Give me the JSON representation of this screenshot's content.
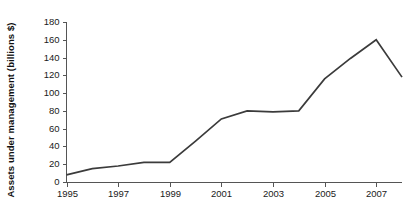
{
  "chart_data": {
    "type": "line",
    "title": "",
    "subtitle": "",
    "xlabel": "",
    "ylabel": "Assets under management (billions $)",
    "x": [
      1995,
      1996,
      1997,
      1998,
      1999,
      2000,
      2001,
      2002,
      2003,
      2004,
      2005,
      2006,
      2007,
      2008
    ],
    "series": [
      {
        "name": "Assets under management",
        "values": [
          8,
          15,
          18,
          22,
          22,
          46,
          71,
          80,
          79,
          80,
          116,
          139,
          160,
          118
        ]
      }
    ],
    "xlim": [
      1995,
      2008
    ],
    "ylim": [
      0,
      180
    ],
    "ytick_labels": [
      "0",
      "20",
      "40",
      "60",
      "80",
      "100",
      "120",
      "140",
      "160",
      "180"
    ],
    "ytick_values": [
      0,
      20,
      40,
      60,
      80,
      100,
      120,
      140,
      160,
      180
    ],
    "xtick_labels": [
      "1995",
      "1997",
      "1999",
      "2001",
      "2003",
      "2005",
      "2007"
    ],
    "xtick_values": [
      1995,
      1997,
      1999,
      2001,
      2003,
      2005,
      2007
    ],
    "grid": false,
    "legend": false,
    "legend_position": "none",
    "line_color": "#3b3b3b",
    "axis_color": "#555555",
    "background_color": "#ffffff",
    "annotations": []
  }
}
